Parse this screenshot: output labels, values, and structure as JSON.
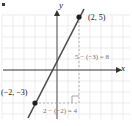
{
  "figure": {
    "kind": "coordinate-plane-line-graph",
    "width": 132,
    "height": 126,
    "background_color": "#ffffff"
  },
  "axes": {
    "x_label": "x",
    "y_label": "y",
    "x_axis_color": "#333333",
    "y_axis_color": "#555555",
    "origin_px": {
      "x": 57,
      "y": 70
    },
    "grid_spacing_px": 11,
    "grid_color": "#e2e2e2"
  },
  "points": [
    {
      "name": "upper-point",
      "label": "(2, 5)",
      "x": 2,
      "y": 5,
      "px": 79,
      "py": 17
    },
    {
      "name": "lower-point",
      "label": "(−2, −3)",
      "x": -2,
      "y": -3,
      "px": 35,
      "py": 103
    }
  ],
  "line": {
    "color": "#4a4a4a",
    "slope": 2,
    "through": "(−2, −3) and (2, 5)"
  },
  "annotations": {
    "rise_text": "5 − (−3) = 8",
    "run_text": "2 − (−2) = 4",
    "rise_color": "#6f6f6f",
    "run_color": "#6f6f6f",
    "dashed_color": "#9a9a9a",
    "right_angle_marker": true
  },
  "marks": {
    "corner_dot_color": "#3a3a3a"
  }
}
